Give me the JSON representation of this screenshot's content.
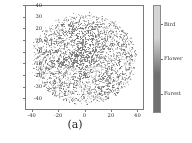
{
  "figure": {
    "caption": "(a)",
    "background_color": "#ffffff"
  },
  "chart_data": {
    "type": "scatter",
    "title": "",
    "subtitle": "",
    "xlabel": "",
    "ylabel": "",
    "xlim": [
      -45,
      45
    ],
    "ylim": [
      -45,
      45
    ],
    "grid": false,
    "xticks": [
      -40,
      -20,
      0,
      20,
      40
    ],
    "xtick_labels": [
      "-40",
      "-20",
      "0",
      "20",
      "40"
    ],
    "yticks": [
      40,
      30,
      20,
      10,
      0,
      -10,
      -20,
      -30,
      -40
    ],
    "ytick_labels": [
      "40",
      "30",
      "20",
      "10",
      "0",
      "-10",
      "-20",
      "-30",
      "-40"
    ],
    "marker_size": 1.1,
    "point_count": 2600,
    "cluster": {
      "center_x": 0,
      "center_y": -1,
      "radius_x": 40,
      "radius_y": 39
    },
    "series": [
      {
        "name": "Bird",
        "color": "#c8c8c8",
        "value": 2,
        "approx_fraction": 0.33
      },
      {
        "name": "Flower",
        "color": "#9a9a9a",
        "value": 1,
        "approx_fraction": 0.34
      },
      {
        "name": "Forest",
        "color": "#6e6e6e",
        "value": 0,
        "approx_fraction": 0.33
      }
    ],
    "colorbar": {
      "orientation": "vertical",
      "position": "right",
      "gradient_from": "#d4d4d4",
      "gradient_to": "#707070",
      "tick_labels": [
        "Bird",
        "Flower",
        "Forest"
      ],
      "tick_positions_fraction": [
        0.18,
        0.5,
        0.82
      ]
    }
  },
  "axes": {
    "frame_color": "#7a7a7a",
    "tick_color": "#2b2b2b"
  }
}
